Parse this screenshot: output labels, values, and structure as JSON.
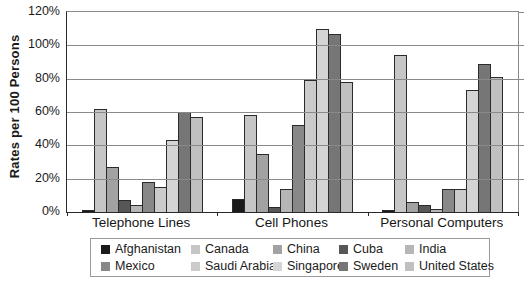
{
  "chart_data": {
    "type": "bar",
    "title": "",
    "ylabel": "Rates per 100 Persons",
    "xlabel": "",
    "categories": [
      "Telephone Lines",
      "Cell Phones",
      "Personal Computers"
    ],
    "y_ticks": [
      "120%",
      "100%",
      "80%",
      "60%",
      "40%",
      "20%",
      "0%"
    ],
    "ylim": [
      0,
      120
    ],
    "grid": true,
    "legend_position": "bottom",
    "series": [
      {
        "name": "Afghanistan",
        "color": "#1a1a1a",
        "values": [
          1.5,
          8,
          1
        ]
      },
      {
        "name": "Canada",
        "color": "#c6c6c6",
        "values": [
          62,
          58,
          94
        ]
      },
      {
        "name": "China",
        "color": "#a2a2a2",
        "values": [
          27,
          35,
          6
        ]
      },
      {
        "name": "Cuba",
        "color": "#575757",
        "values": [
          7,
          3,
          4
        ]
      },
      {
        "name": "India",
        "color": "#b6b6b6",
        "values": [
          4,
          14,
          2
        ]
      },
      {
        "name": "Mexico",
        "color": "#888888",
        "values": [
          18,
          52,
          14
        ]
      },
      {
        "name": "Saudi Arabia",
        "color": "#cbcbcb",
        "values": [
          15,
          79,
          14
        ]
      },
      {
        "name": "Singapore",
        "color": "#d4d4d4",
        "values": [
          43,
          110,
          73
        ]
      },
      {
        "name": "Sweden",
        "color": "#767676",
        "values": [
          60,
          107,
          89
        ]
      },
      {
        "name": "United States",
        "color": "#c0c0c0",
        "values": [
          57,
          78,
          81
        ]
      }
    ]
  }
}
